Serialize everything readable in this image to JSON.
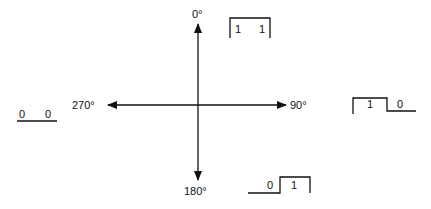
{
  "diagram": {
    "type": "phase-constellation",
    "axes": {
      "top": "0°",
      "right": "90°",
      "bottom": "180°",
      "left": "270°"
    },
    "waveforms": [
      {
        "angle": "0°",
        "bits": [
          "1",
          "1"
        ]
      },
      {
        "angle": "90°",
        "bits": [
          "1",
          "0"
        ]
      },
      {
        "angle": "180°",
        "bits": [
          "0",
          "1"
        ]
      },
      {
        "angle": "270°",
        "bits": [
          "0",
          "0"
        ]
      }
    ]
  }
}
